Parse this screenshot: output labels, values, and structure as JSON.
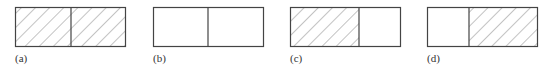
{
  "figure": {
    "panels": [
      {
        "id": "a",
        "label": "(a)",
        "left": "hatched",
        "right": "hatched",
        "x": 15,
        "divider": 71
      },
      {
        "id": "b",
        "label": "(b)",
        "left": "empty",
        "right": "empty",
        "x": 153,
        "divider": 208
      },
      {
        "id": "c",
        "label": "(c)",
        "left": "hatched",
        "right": "empty",
        "x": 290,
        "divider": 359
      },
      {
        "id": "d",
        "label": "(d)",
        "left": "empty",
        "right": "hatched",
        "x": 427,
        "divider": 469
      }
    ],
    "box": {
      "y": 7,
      "width": 111,
      "height": 40
    },
    "colors": {
      "stroke": "#444444",
      "hatch": "#6a6a6a",
      "background": "#ffffff"
    }
  }
}
